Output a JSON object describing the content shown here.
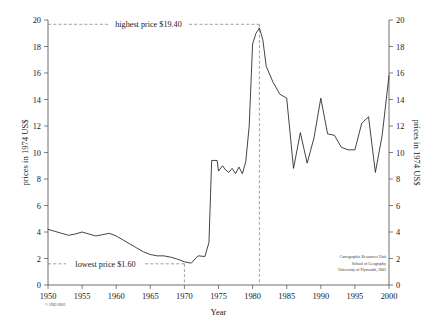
{
  "chart_data": {
    "type": "line",
    "title": "",
    "xlabel": "Year",
    "ylabel": "prices in 1974 US$",
    "ylabel_right": "prices in 1974 US$",
    "xlim": [
      1950,
      2000
    ],
    "ylim": [
      0,
      20
    ],
    "grid": false,
    "legend": "none",
    "xticks": [
      1950,
      1955,
      1960,
      1965,
      1970,
      1975,
      1980,
      1985,
      1990,
      1995,
      2000
    ],
    "xtick_labels": [
      "1950",
      "1955",
      "1960",
      "1965",
      "1970",
      "1975",
      "1980",
      "1985",
      "1990",
      "1995",
      "2000"
    ],
    "yticks": [
      0,
      2,
      4,
      6,
      8,
      10,
      12,
      14,
      16,
      18,
      20
    ],
    "ytick_labels": [
      "0",
      "2",
      "4",
      "6",
      "8",
      "10",
      "12",
      "14",
      "16",
      "18",
      "20"
    ],
    "series": [
      {
        "name": "Crude oil price in 1974 US$",
        "x": [
          1950,
          1951,
          1952,
          1953,
          1954,
          1955,
          1956,
          1957,
          1958,
          1959,
          1960,
          1961,
          1962,
          1963,
          1964,
          1965,
          1966,
          1967,
          1968,
          1969,
          1970,
          1971,
          1972,
          1973,
          1973.6,
          1974,
          1974.8,
          1975,
          1975.6,
          1976,
          1976.5,
          1977,
          1977.5,
          1978,
          1978.5,
          1979,
          1979.5,
          1980,
          1980.5,
          1981,
          1981.5,
          1982,
          1983,
          1984,
          1985,
          1986,
          1987,
          1988,
          1989,
          1990,
          1991,
          1992,
          1993,
          1994,
          1995,
          1996,
          1997,
          1998,
          1999,
          2000
        ],
        "values": [
          4.2,
          4.05,
          3.9,
          3.75,
          3.85,
          4.0,
          3.85,
          3.7,
          3.8,
          3.9,
          3.7,
          3.4,
          3.1,
          2.8,
          2.5,
          2.3,
          2.2,
          2.2,
          2.1,
          1.95,
          1.75,
          1.65,
          2.2,
          2.15,
          3.2,
          9.4,
          9.4,
          8.6,
          9.0,
          8.7,
          8.5,
          8.8,
          8.4,
          8.9,
          8.4,
          9.3,
          12.0,
          18.2,
          19.0,
          19.4,
          18.5,
          16.5,
          15.3,
          14.4,
          14.1,
          8.8,
          11.5,
          9.2,
          11.1,
          14.1,
          11.4,
          11.3,
          10.4,
          10.2,
          10.2,
          12.2,
          12.7,
          8.5,
          11.3,
          15.8
        ]
      }
    ],
    "annotations": [
      {
        "name": "highest-price",
        "label": "highest price $19.40",
        "value": 19.4,
        "year": 1981
      },
      {
        "name": "lowest-price",
        "label": "lowest price $1.60",
        "value": 1.6,
        "year": 1970
      }
    ]
  },
  "credit": {
    "line1": "Cartographic Resources Unit",
    "line2": "School of Geography",
    "line3": "University of Plymouth, 2003"
  },
  "copyright": {
    "text": "© 1963-2003"
  },
  "colors": {
    "line": "#222222",
    "axis": "#4a4a4a",
    "dashed": "#777777",
    "background": "#ffffff"
  }
}
